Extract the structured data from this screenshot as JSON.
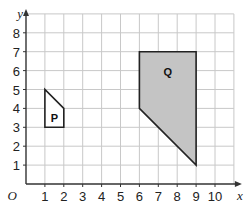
{
  "diagram": {
    "type": "coordinate-grid",
    "x_axis_label": "x",
    "y_axis_label": "y",
    "origin_label": "O",
    "x_ticks": [
      "1",
      "2",
      "3",
      "4",
      "5",
      "6",
      "7",
      "8",
      "9",
      "10"
    ],
    "y_ticks": [
      "1",
      "2",
      "3",
      "4",
      "5",
      "6",
      "7",
      "8"
    ],
    "grid": {
      "x_max": 11,
      "y_max": 9
    },
    "colors": {
      "grid": "#c8c8c8",
      "axis": "#333333",
      "shape_outline": "#222222",
      "q_fill": "#c4c4c4",
      "p_fill": "#ffffff"
    },
    "shapes": [
      {
        "label": "P",
        "vertices": [
          [
            1,
            3
          ],
          [
            1,
            5
          ],
          [
            2,
            4
          ],
          [
            2,
            3
          ]
        ],
        "label_pos": [
          1.5,
          3.5
        ]
      },
      {
        "label": "Q",
        "vertices": [
          [
            6,
            4
          ],
          [
            6,
            7
          ],
          [
            9,
            7
          ],
          [
            9,
            1
          ]
        ],
        "label_pos": [
          7.5,
          5.9
        ]
      }
    ]
  }
}
